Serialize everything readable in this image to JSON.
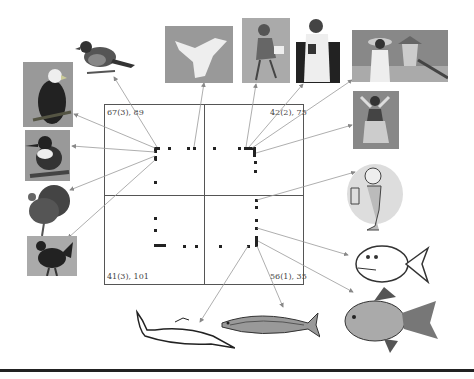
{
  "figure": {
    "quadrants": [
      {
        "id": "top-left",
        "label": "67(3), 89"
      },
      {
        "id": "top-right",
        "label": "42(2), 75"
      },
      {
        "id": "bottom-left",
        "label": "41(3), 101"
      },
      {
        "id": "bottom-right",
        "label": "56(1), 35"
      }
    ],
    "categories": {
      "birds": [
        "robin",
        "bald eagle",
        "kingfisher",
        "turkey",
        "rooster"
      ],
      "people": [
        "angel",
        "walking woman",
        "doctor",
        "woman with hat at temple",
        "hula dancer",
        "mermaid"
      ],
      "fish": [
        "cartoon fish",
        "swordfish",
        "mackerel",
        "goldfish"
      ]
    }
  }
}
